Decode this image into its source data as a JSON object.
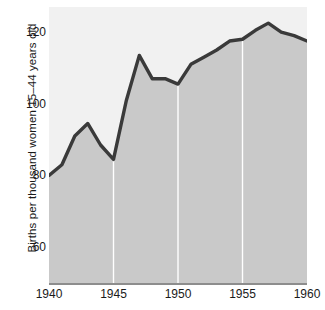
{
  "chart_data": {
    "type": "area",
    "title": "",
    "xlabel": "",
    "ylabel": "Births per thousand women 15–44 years old",
    "x": [
      1940,
      1941,
      1942,
      1943,
      1944,
      1945,
      1946,
      1947,
      1948,
      1949,
      1950,
      1951,
      1952,
      1953,
      1954,
      1955,
      1956,
      1957,
      1958,
      1959,
      1960
    ],
    "values": [
      80,
      83,
      91,
      94.5,
      88.5,
      84.5,
      101,
      113.5,
      107,
      107,
      105.5,
      111,
      113,
      115,
      117.5,
      118,
      120.5,
      122.5,
      120,
      119,
      117.5
    ],
    "series": [
      {
        "name": "Births per thousand women 15–44 years old",
        "values": [
          80,
          83,
          91,
          94.5,
          88.5,
          84.5,
          101,
          113.5,
          107,
          107,
          105.5,
          111,
          113,
          115,
          117.5,
          118,
          120.5,
          122.5,
          120,
          119,
          117.5
        ]
      }
    ],
    "xlim": [
      1940,
      1960
    ],
    "ylim": [
      50,
      127
    ],
    "x_ticks": [
      1940,
      1945,
      1950,
      1955,
      1960
    ],
    "x_tick_labels": [
      "1940",
      "1945",
      "1950",
      "1955",
      "1960"
    ],
    "y_ticks": [
      60,
      80,
      100,
      120
    ],
    "y_tick_labels": [
      "60",
      "80",
      "100",
      "120"
    ],
    "gridlines": {
      "vertical_at": [
        1945,
        1950,
        1955
      ],
      "horizontal": false,
      "color": "#ffffff"
    },
    "legend": null,
    "annotations": [],
    "colors": {
      "line": "#3a3a3a",
      "fill": "#c9c9c9",
      "plot_background": "#f1f1f1",
      "gridline": "#ffffff",
      "axis": "#8d8d8d",
      "text": "#1a1a1a",
      "page_background": "#ffffff"
    },
    "line_width": 3.4
  }
}
